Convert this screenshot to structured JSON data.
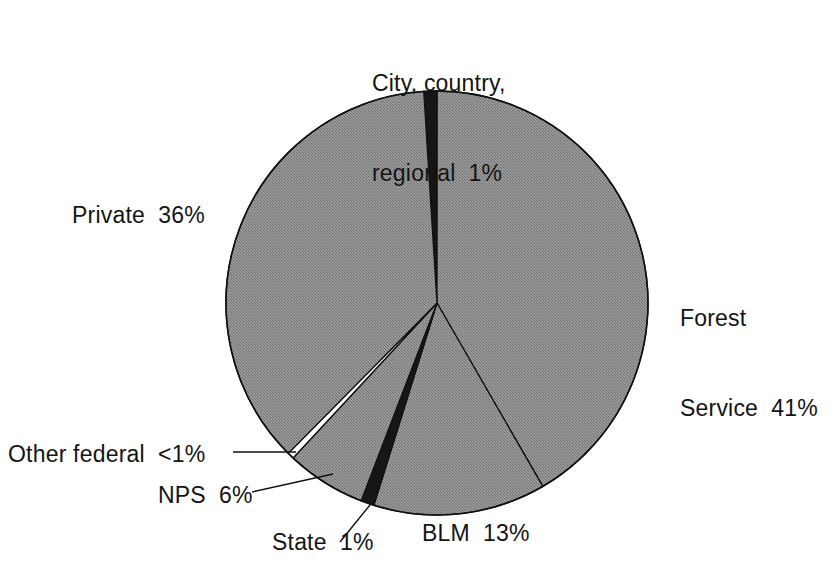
{
  "chart": {
    "type": "pie",
    "title": "",
    "geometry": {
      "center_x": 437,
      "center_y": 303,
      "radius_x": 211,
      "radius_y": 212
    }
  },
  "labels": {
    "city": {
      "line1": "City, country,",
      "line2": "regional  1%"
    },
    "private": "Private  36%",
    "forest": {
      "line1": "Forest",
      "line2": "Service  41%"
    },
    "other_federal": "Other federal  <1%",
    "nps": "NPS  6%",
    "state": "State  1%",
    "blm": "BLM  13%"
  },
  "colors": {
    "gray_fill": "#8a8a8a",
    "dark_fill": "#161616",
    "white_fill": "#ffffff",
    "outline": "#111111",
    "background": "#ffffff",
    "text": "#141414"
  },
  "chart_data": {
    "type": "pie",
    "title": "",
    "subtitle": "",
    "xlabel": "",
    "ylabel": "",
    "legend_position": "none",
    "grid": false,
    "units": "percent",
    "start_angle_deg": -3.6,
    "direction": "clockwise",
    "categories": [
      "City, country, regional",
      "Forest Service",
      "BLM",
      "State",
      "NPS",
      "Other federal",
      "Private"
    ],
    "values": [
      1,
      41,
      13,
      1,
      6,
      0.5,
      36
    ],
    "value_labels": [
      "1%",
      "41%",
      "13%",
      "1%",
      "6%",
      "<1%",
      "36%"
    ],
    "slice_fills": [
      "dark",
      "gray",
      "gray",
      "dark",
      "gray",
      "white",
      "gray"
    ],
    "slices": [
      {
        "name": "City, country, regional",
        "value": 1,
        "label": "1%",
        "fill": "#161616",
        "leader_line": false
      },
      {
        "name": "Forest Service",
        "value": 41,
        "label": "41%",
        "fill": "#8a8a8a",
        "leader_line": false
      },
      {
        "name": "BLM",
        "value": 13,
        "label": "13%",
        "fill": "#8a8a8a",
        "leader_line": false
      },
      {
        "name": "State",
        "value": 1,
        "label": "1%",
        "fill": "#161616",
        "leader_line": true
      },
      {
        "name": "NPS",
        "value": 6,
        "label": "6%",
        "fill": "#8a8a8a",
        "leader_line": true
      },
      {
        "name": "Other federal",
        "value": 0.5,
        "label": "<1%",
        "fill": "#ffffff",
        "leader_line": true
      },
      {
        "name": "Private",
        "value": 36,
        "label": "36%",
        "fill": "#8a8a8a",
        "leader_line": false
      }
    ]
  }
}
